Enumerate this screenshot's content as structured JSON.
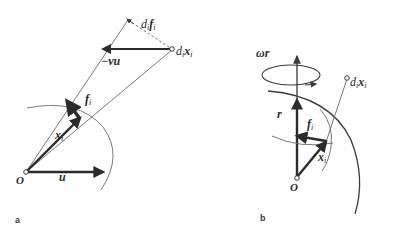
{
  "figure": {
    "background_color": "#ffffff",
    "stroke_color": "#3a3a3a",
    "thick_stroke_color": "#2b2b2b"
  },
  "panel_a": {
    "letter": "a",
    "labels": {
      "di_fi_main": "d",
      "di_fi_sub1": "i",
      "di_fi_f": "f",
      "di_fi_sub2": "i",
      "di_xi_main": "d",
      "di_xi_sub1": "i",
      "di_xi_x": "x",
      "di_xi_sub2": "i",
      "minus_nu_u": "−νu",
      "fi": "f",
      "fi_sub": "i",
      "xi": "x",
      "xi_sub": "i",
      "u": "u",
      "origin": "O"
    }
  },
  "panel_b": {
    "letter": "b",
    "labels": {
      "omega_r": "ωr",
      "di_xi_main": "d",
      "di_xi_sub1": "i",
      "di_xi_x": "x",
      "di_xi_sub2": "i",
      "r": "r",
      "fi": "f",
      "fi_sub": "i",
      "xi": "x",
      "xi_sub": "i",
      "origin": "O"
    }
  }
}
